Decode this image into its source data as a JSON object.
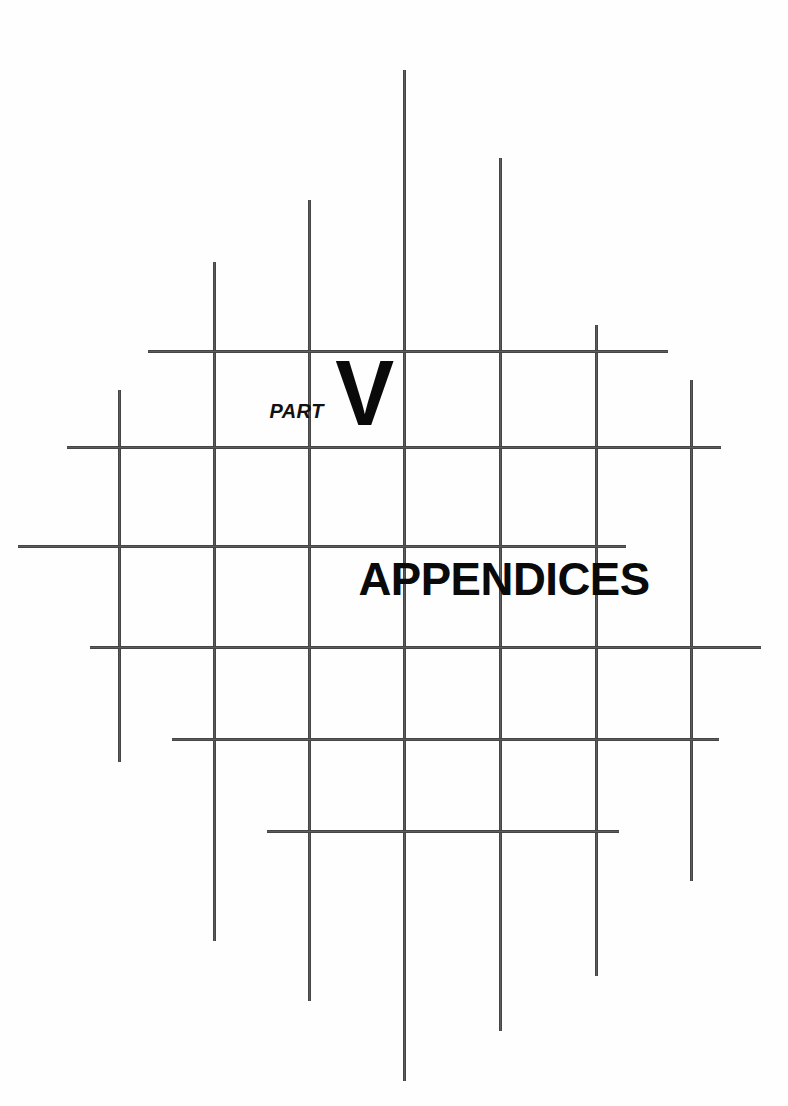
{
  "page": {
    "kind": "book-part-divider",
    "background_color": "#ffffff",
    "ink_color": "#3f3f3f",
    "text_color": "#0a0a0a"
  },
  "part_marker": {
    "label": "PART",
    "numeral": "V"
  },
  "title": {
    "text": "APPENDICES"
  },
  "decoration": {
    "name": "crosshatch-grid",
    "line_color": "#4a4a4a",
    "line_weight_px": 3,
    "vertical_lines": [
      {
        "x": 118,
        "y1": 390,
        "y2": 762
      },
      {
        "x": 213,
        "y1": 262,
        "y2": 941
      },
      {
        "x": 308,
        "y1": 200,
        "y2": 1001
      },
      {
        "x": 403,
        "y1": 70,
        "y2": 1081
      },
      {
        "x": 499,
        "y1": 158,
        "y2": 1031
      },
      {
        "x": 595,
        "y1": 325,
        "y2": 976
      },
      {
        "x": 690,
        "y1": 380,
        "y2": 881
      }
    ],
    "horizontal_lines": [
      {
        "y": 350,
        "x1": 148,
        "x2": 668
      },
      {
        "y": 446,
        "x1": 67,
        "x2": 721
      },
      {
        "y": 545,
        "x1": 18,
        "x2": 626
      },
      {
        "y": 646,
        "x1": 90,
        "x2": 761
      },
      {
        "y": 738,
        "x1": 172,
        "x2": 719
      },
      {
        "y": 830,
        "x1": 267,
        "x2": 619
      }
    ]
  }
}
